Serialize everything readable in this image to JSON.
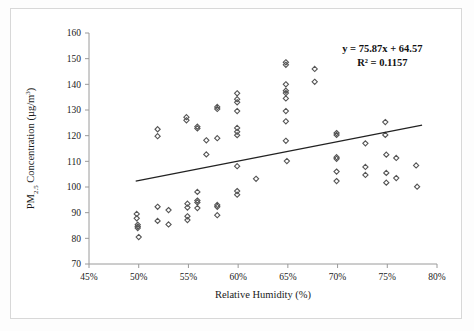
{
  "chart_data": {
    "type": "scatter",
    "title": "",
    "xlabel": "Relative Humidity (%)",
    "ylabel": "PM2.5 Concentration (µg/m3)",
    "ylabel_parts": {
      "prefix": "PM",
      "subscript": "2.5",
      "middle": " Concentration (µg/m",
      "superscript": "3",
      "suffix": ")"
    },
    "xlim": [
      45,
      80
    ],
    "ylim": [
      70,
      160
    ],
    "xticks": [
      45,
      50,
      55,
      60,
      65,
      70,
      75,
      80
    ],
    "xtick_labels": [
      "45%",
      "50%",
      "55%",
      "60%",
      "65%",
      "70%",
      "75%",
      "80%"
    ],
    "yticks": [
      70,
      80,
      90,
      100,
      110,
      120,
      130,
      140,
      150,
      160
    ],
    "ytick_labels": [
      "70",
      "80",
      "90",
      "100",
      "110",
      "120",
      "130",
      "140",
      "150",
      "160"
    ],
    "grid": false,
    "legend": null,
    "marker_style": "open-diamond",
    "marker_color": "#555555",
    "trendline": {
      "equation_label": "y = 75.87x + 64.57",
      "r2_label": "R² = 0.1157",
      "slope": 75.87,
      "intercept": 64.57,
      "r_squared": 0.1157,
      "x_start": 49.7,
      "y_start": 102.3,
      "x_end": 78.5,
      "y_end": 124.1,
      "color": "#222222"
    },
    "annotations": [
      {
        "text": "y = 75.87x + 64.57",
        "x": 74.5,
        "y": 152.5
      },
      {
        "text": "R² = 0.1157",
        "x": 74.5,
        "y": 147.0
      }
    ],
    "points": [
      {
        "x": 49.8,
        "y": 89.5
      },
      {
        "x": 49.8,
        "y": 87.8
      },
      {
        "x": 49.9,
        "y": 85.3
      },
      {
        "x": 49.9,
        "y": 84.6
      },
      {
        "x": 49.9,
        "y": 84.0
      },
      {
        "x": 50.0,
        "y": 80.5
      },
      {
        "x": 51.9,
        "y": 122.5
      },
      {
        "x": 51.9,
        "y": 119.8
      },
      {
        "x": 51.9,
        "y": 92.3
      },
      {
        "x": 51.9,
        "y": 86.8
      },
      {
        "x": 53.0,
        "y": 91.0
      },
      {
        "x": 53.0,
        "y": 85.4
      },
      {
        "x": 54.8,
        "y": 127.2
      },
      {
        "x": 54.8,
        "y": 126.0
      },
      {
        "x": 54.9,
        "y": 93.5
      },
      {
        "x": 54.9,
        "y": 92.0
      },
      {
        "x": 54.9,
        "y": 88.6
      },
      {
        "x": 54.9,
        "y": 87.1
      },
      {
        "x": 55.9,
        "y": 123.5
      },
      {
        "x": 55.9,
        "y": 122.8
      },
      {
        "x": 55.9,
        "y": 98.1
      },
      {
        "x": 55.9,
        "y": 94.7
      },
      {
        "x": 55.9,
        "y": 94.0
      },
      {
        "x": 55.9,
        "y": 91.8
      },
      {
        "x": 56.8,
        "y": 118.2
      },
      {
        "x": 56.8,
        "y": 112.7
      },
      {
        "x": 57.9,
        "y": 131.2
      },
      {
        "x": 57.9,
        "y": 130.4
      },
      {
        "x": 57.9,
        "y": 119.0
      },
      {
        "x": 57.9,
        "y": 93.0
      },
      {
        "x": 57.9,
        "y": 92.3
      },
      {
        "x": 57.9,
        "y": 89.0
      },
      {
        "x": 59.9,
        "y": 136.5
      },
      {
        "x": 59.9,
        "y": 134.2
      },
      {
        "x": 59.9,
        "y": 133.0
      },
      {
        "x": 59.9,
        "y": 129.6
      },
      {
        "x": 59.9,
        "y": 123.0
      },
      {
        "x": 59.9,
        "y": 121.5
      },
      {
        "x": 59.9,
        "y": 120.2
      },
      {
        "x": 59.9,
        "y": 108.1
      },
      {
        "x": 59.9,
        "y": 98.4
      },
      {
        "x": 59.9,
        "y": 97.0
      },
      {
        "x": 61.8,
        "y": 103.2
      },
      {
        "x": 64.8,
        "y": 148.6
      },
      {
        "x": 64.8,
        "y": 147.6
      },
      {
        "x": 64.8,
        "y": 140.0
      },
      {
        "x": 64.8,
        "y": 137.5
      },
      {
        "x": 64.8,
        "y": 136.6
      },
      {
        "x": 64.8,
        "y": 134.5
      },
      {
        "x": 64.8,
        "y": 129.6
      },
      {
        "x": 64.8,
        "y": 125.6
      },
      {
        "x": 64.8,
        "y": 118.0
      },
      {
        "x": 64.9,
        "y": 110.1
      },
      {
        "x": 67.7,
        "y": 146.0
      },
      {
        "x": 67.7,
        "y": 141.0
      },
      {
        "x": 69.9,
        "y": 121.0
      },
      {
        "x": 69.9,
        "y": 120.3
      },
      {
        "x": 69.9,
        "y": 111.6
      },
      {
        "x": 69.9,
        "y": 111.0
      },
      {
        "x": 69.9,
        "y": 106.0
      },
      {
        "x": 69.9,
        "y": 102.3
      },
      {
        "x": 72.8,
        "y": 117.0
      },
      {
        "x": 72.8,
        "y": 107.8
      },
      {
        "x": 72.8,
        "y": 104.7
      },
      {
        "x": 74.8,
        "y": 125.3
      },
      {
        "x": 74.8,
        "y": 120.3
      },
      {
        "x": 74.9,
        "y": 112.6
      },
      {
        "x": 74.9,
        "y": 105.5
      },
      {
        "x": 74.9,
        "y": 101.7
      },
      {
        "x": 75.9,
        "y": 111.3
      },
      {
        "x": 75.9,
        "y": 103.5
      },
      {
        "x": 77.9,
        "y": 108.4
      },
      {
        "x": 78.0,
        "y": 100.1
      }
    ]
  }
}
